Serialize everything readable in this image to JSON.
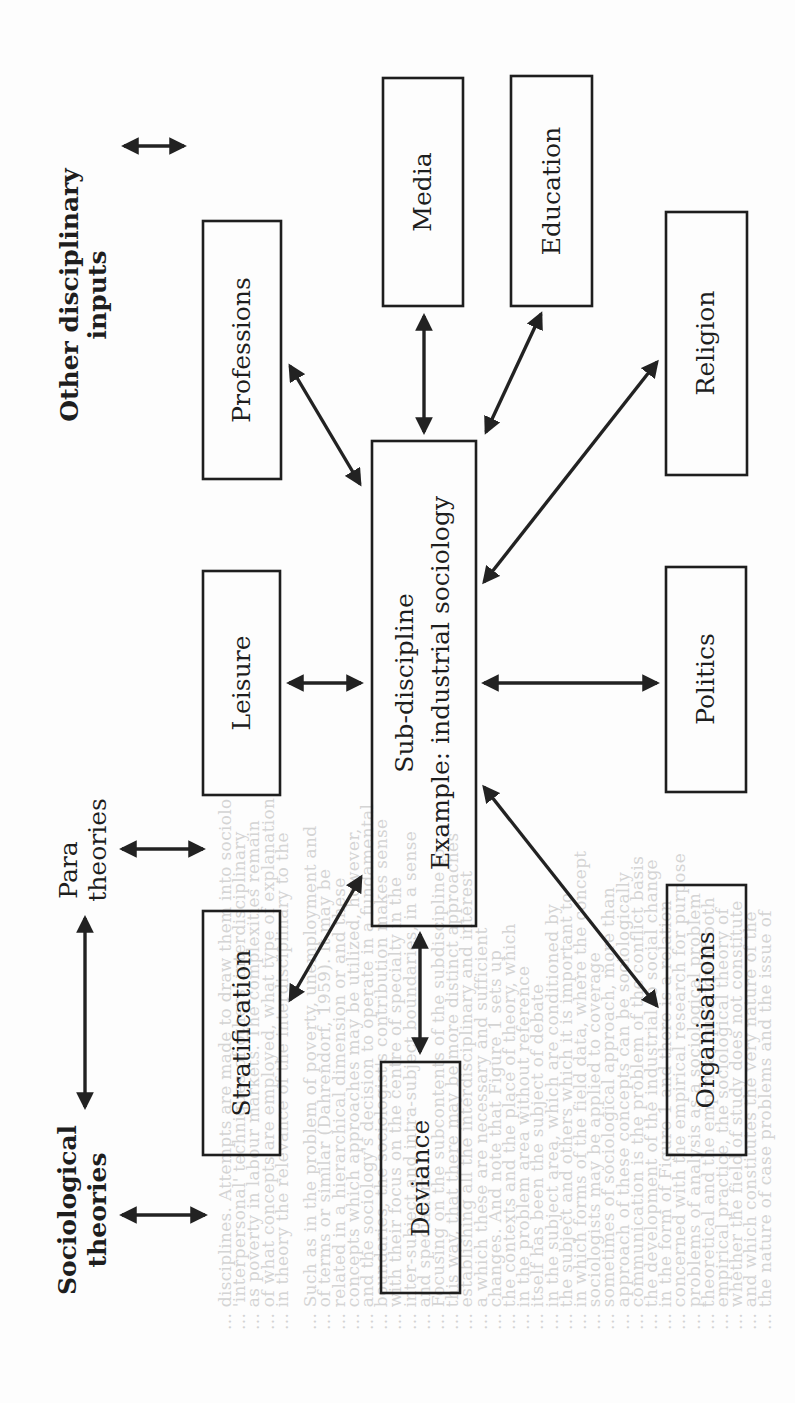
{
  "figure": {
    "orientation": "rotated-90-ccw",
    "ink_color": "#1e1e1e",
    "paper_color": "#fdfdfd",
    "left_inputs": [
      {
        "id": "other",
        "lines": [
          "Other disciplinary",
          "inputs"
        ]
      },
      {
        "id": "para",
        "lines": [
          "Para",
          "theories"
        ]
      },
      {
        "id": "socio",
        "lines": [
          "Sociological",
          "theories"
        ]
      }
    ],
    "center": {
      "lines": [
        "Sub-discipline",
        "Example: industrial sociology"
      ]
    },
    "nodes": {
      "professions": "Professions",
      "leisure": "Leisure",
      "stratification": "Stratification",
      "media": "Media",
      "education": "Education",
      "religion": "Religion",
      "politics": "Politics",
      "organisations": "Organisations",
      "deviance": "Deviance"
    },
    "connections": [
      {
        "from": "center",
        "to": "professions",
        "type": "bidirectional"
      },
      {
        "from": "center",
        "to": "leisure",
        "type": "bidirectional"
      },
      {
        "from": "center",
        "to": "stratification",
        "type": "bidirectional"
      },
      {
        "from": "center",
        "to": "media",
        "type": "bidirectional"
      },
      {
        "from": "center",
        "to": "education",
        "type": "bidirectional"
      },
      {
        "from": "center",
        "to": "religion",
        "type": "bidirectional"
      },
      {
        "from": "center",
        "to": "politics",
        "type": "bidirectional"
      },
      {
        "from": "center",
        "to": "organisations",
        "type": "bidirectional"
      },
      {
        "from": "center",
        "to": "deviance",
        "type": "bidirectional"
      },
      {
        "from": "other",
        "to": "diagram",
        "type": "bidirectional"
      },
      {
        "from": "para",
        "to": "diagram",
        "type": "bidirectional"
      },
      {
        "from": "socio",
        "to": "diagram",
        "type": "bidirectional"
      },
      {
        "from": "socio",
        "to": "para",
        "type": "bidirectional"
      }
    ]
  },
  "bleed_through": {
    "note": "faint reverse-side text visible through the page",
    "lines": [
      "... disciplines. Attempts are made to draw them into sociolo",
      "... 'interpersonal' techniques of others' interdisciplinary",
      "... as poverty in labour markets. The complexities remain",
      "... of what concepts are employed, what type of explanation",
      "... in theory the relevance of the interdisciplinary to the",
      "",
      "... Such as in the problem of poverty, unemployment and",
      "... of terms or similar (Dahrendorf, 1959). It may be",
      "... related in a hierarchical dimension or and these",
      "... concepts which approaches may be utilized, however,",
      "... and the sociology's decision to operate in a fundamental",
      "... boundaries; the sociologist's contribution makes sense",
      "... with their focus on the centre of specialty in the",
      "... inter-subject and intra-subject boundaries, in a sense",
      "... and specialism.",
      "... Focusing on the subcontents of the subdiscipline to",
      "... this way, that there may be more distinct approaches",
      "... establishing all the interdisciplinary and interest",
      "... a which these are necessary and sufficient",
      "... changes. And note that Figure 1 sets up",
      "... the contexts and the place of theory, which",
      "... in the problem area without reference",
      "... itself has been the subject of debate",
      "... in the subject area, which are conditioned by",
      "... the subject and others which it is important to",
      "... in which forms of the field data, where the concept",
      "... sociologists may be applied to coverage",
      "... sometimes of sociological approach, more than",
      "... approach of these concepts can be sociologically",
      "... communication is the problem of the conflict basis",
      "... the development of the industrial to social change",
      "... in the form of Figure 1 and there is a relation",
      "... concerned with the empirical research for purpose",
      "... problems of analysis as a sociological problem",
      "... theoretical and the empirical question of both",
      "... empirical practice, the sociological theory of",
      "... whether the field of study does not constitute",
      "... and which constitutes the very nature of the",
      "... the nature of case problems and the issue of"
    ]
  }
}
